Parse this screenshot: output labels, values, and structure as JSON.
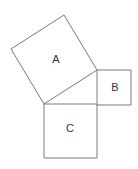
{
  "diagram": {
    "title": "",
    "squares": [
      {
        "label": "A",
        "points": "11,49 64,15 97,70 44,104",
        "label_x": 56,
        "label_y": 60
      },
      {
        "label": "B",
        "points": "97,70 131,70 131,105 97,105",
        "label_x": 115,
        "label_y": 88
      },
      {
        "label": "C",
        "points": "44,104 97,104 97,158 44,158",
        "label_x": 70,
        "label_y": 129
      }
    ],
    "stroke_color": "#7a7a7a",
    "background": "#ffffff"
  }
}
